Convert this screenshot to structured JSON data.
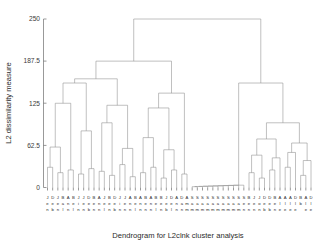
{
  "figure": {
    "xlabel": "Dendrogram for L2clnk cluster analysis",
    "ylabel": "L2 dissimilarity measure",
    "line_color": "#8c8c8c",
    "axis_color": "#6d6d6d",
    "text_color": "#2b2b2b"
  },
  "chart_data": {
    "type": "dendrogram",
    "title": "",
    "xlabel": "Dendrogram for L2clnk cluster analysis",
    "ylabel": "L2 dissimilarity measure",
    "grid": false,
    "legend": "none",
    "ylim": [
      0,
      250
    ],
    "yticks": [
      0,
      62.5,
      125,
      187.5,
      250
    ],
    "ytick_labels": [
      "0",
      "62.5",
      "125",
      "187.5",
      "250"
    ],
    "n_leaves": 48,
    "linkage_method": "L2clnk",
    "leaf_labels": [
      "Jee",
      "Dein",
      "Jee",
      "Bell",
      "Ane",
      "Bell",
      "Jin",
      "Jee",
      "Dein",
      "Bein",
      "Ann",
      "Jell",
      "Bein",
      "Dee",
      "Jin",
      "Jee",
      "Ane",
      "Bell",
      "Ann",
      "Bein",
      "Ane",
      "Bell",
      "Bein",
      "Jeb",
      "Dell",
      "Ane",
      "Dan",
      "Amm",
      "Samm",
      "Samm",
      "Samm",
      "Samm",
      "Samm",
      "Samm",
      "Samm",
      "Samm",
      "Samm",
      "Samm",
      "Sein",
      "Bein",
      "Jenn",
      "Jonb",
      "Deb",
      "Dell",
      "Bein",
      "Ale",
      "Ale",
      "Dle",
      "Bb"
    ],
    "leaf_label_lines": [
      [
        "J",
        "D",
        "J",
        "B",
        "A",
        "B",
        "J",
        "J",
        "D",
        "B",
        "A",
        "J",
        "B",
        "D",
        "J",
        "J",
        "A",
        "B",
        "A",
        "B",
        "A",
        "B",
        "B",
        "J",
        "D",
        "A",
        "D",
        "A",
        "S",
        "S",
        "S",
        "S",
        "S",
        "S",
        "S",
        "S",
        "S",
        "S",
        "S",
        "B",
        "J",
        "J",
        "D",
        "D",
        "B",
        "A",
        "A",
        "A",
        "D",
        "B",
        "A",
        "D"
      ],
      [
        "e",
        "e",
        "e",
        "a",
        "n",
        "e",
        "i",
        "e",
        "e",
        "e",
        "n",
        "e",
        "e",
        "e",
        "i",
        "e",
        "n",
        "e",
        "n",
        "e",
        "n",
        "e",
        "e",
        "e",
        "e",
        "n",
        "a",
        "m",
        "a",
        "a",
        "a",
        "a",
        "a",
        "a",
        "a",
        "a",
        "a",
        "a",
        "e",
        "e",
        "e",
        "o",
        "e",
        "e",
        "e",
        "l",
        "l",
        "l",
        "l",
        "b",
        "l",
        "l"
      ],
      [
        "n",
        "b",
        "n",
        "l",
        "n",
        "l",
        "n",
        "n",
        "b",
        "n",
        "n",
        "l",
        "n",
        "b",
        "n",
        "n",
        "n",
        "l",
        "n",
        "n",
        "n",
        "l",
        "n",
        "b",
        "l",
        "n",
        "n",
        "m",
        "m",
        "m",
        "m",
        "m",
        "m",
        "m",
        "m",
        "m",
        "m",
        "m",
        "n",
        "n",
        "n",
        "n",
        "b",
        "b",
        "n",
        "e",
        "e",
        "e",
        "e",
        "",
        "e",
        "e"
      ]
    ],
    "merge_heights_approx": [
      250,
      187.5,
      155,
      125,
      118,
      100,
      96,
      88,
      75,
      68,
      62.5,
      58,
      52,
      45,
      40,
      35,
      30,
      25,
      20,
      15,
      12,
      10,
      8,
      6,
      4,
      2,
      1
    ],
    "root_height": 250
  }
}
